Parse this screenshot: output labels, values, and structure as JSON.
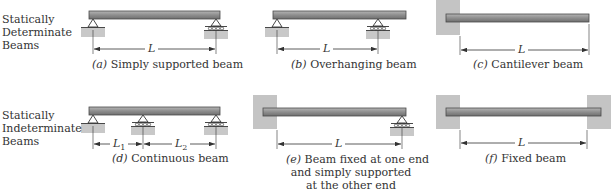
{
  "rows": [
    {
      "label_lines": [
        "Statically",
        "Determinate",
        "Beams"
      ]
    },
    {
      "label_lines": [
        "Statically",
        "Indeterminate",
        "Beams"
      ]
    }
  ],
  "diagrams": [
    {
      "id": "a",
      "letter": "(a)",
      "caption": "Simply supported beam",
      "spans": [
        "L"
      ]
    },
    {
      "id": "b",
      "letter": "(b)",
      "caption": "Overhanging beam",
      "spans": [
        "L"
      ]
    },
    {
      "id": "c",
      "letter": "(c)",
      "caption": "Cantilever beam",
      "spans": [
        "L"
      ]
    },
    {
      "id": "d",
      "letter": "(d)",
      "caption": "Continuous beam",
      "spans": [
        "L1",
        "L2"
      ]
    },
    {
      "id": "e",
      "letter": "(e)",
      "caption_lines": [
        "Beam fixed at one end",
        "and simply supported",
        "at the other end"
      ],
      "spans": [
        "L"
      ]
    },
    {
      "id": "f",
      "letter": "(f)",
      "caption": "Fixed beam",
      "spans": [
        "L"
      ]
    }
  ],
  "colors": {
    "beam_fill": "#8e8e8e",
    "beam_edge": "#4a4a4a",
    "ground_fill": "#c8c8c8",
    "wall_fill": "#c4c4c4",
    "line": "#333333"
  }
}
